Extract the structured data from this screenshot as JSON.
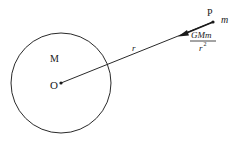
{
  "diagram": {
    "type": "gravitational-force-diagram",
    "mass_body": {
      "center_label": "O",
      "mass_label": "M",
      "shape": "circle"
    },
    "point": {
      "label": "P",
      "mass_label": "m"
    },
    "distance_label": "r",
    "force_label": {
      "numerator": "GMm",
      "denominator": "r",
      "denominator_exponent": "2"
    },
    "colors": {
      "stroke": "#2a2a2a",
      "text": "#1a1a1a",
      "background": "#ffffff"
    }
  }
}
